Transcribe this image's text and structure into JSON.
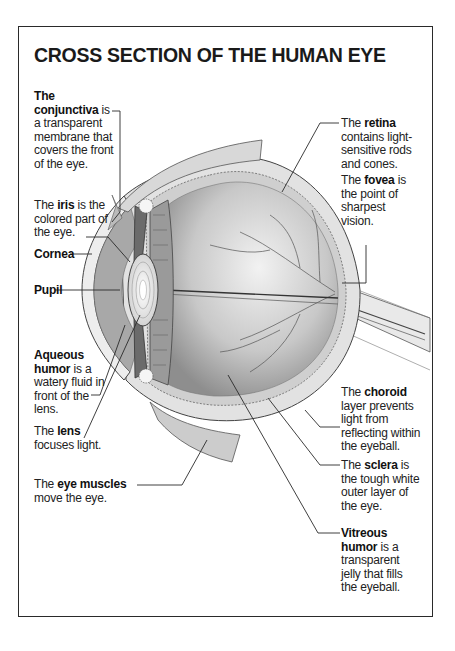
{
  "title": "CROSS SECTION OF THE HUMAN EYE",
  "labels": {
    "conjunctiva": {
      "pre": "The",
      "term": "conjunctiva",
      "post": " is",
      "desc": "a transparent membrane that covers the front of the eye."
    },
    "iris": {
      "pre": "The ",
      "term": "iris",
      "post": " is the colored part of the eye."
    },
    "cornea": {
      "term": "Cornea"
    },
    "pupil": {
      "term": "Pupil"
    },
    "aqueous": {
      "term1": "Aqueous",
      "term2": "humor",
      "post": " is a watery fluid in front of the lens."
    },
    "lens": {
      "pre": "The ",
      "term": "lens",
      "post": " focuses light."
    },
    "muscles": {
      "pre": "The ",
      "term": "eye muscles",
      "post": " move the eye."
    },
    "retina": {
      "pre": "The ",
      "term": "retina",
      "post": " contains light-sensitive rods and cones."
    },
    "fovea": {
      "pre": "The ",
      "term": "fovea",
      "post": " is the point of sharpest vision."
    },
    "choroid": {
      "pre": "The ",
      "term": "choroid",
      "post": " layer prevents light from reflecting within the eyeball."
    },
    "sclera": {
      "pre": "The ",
      "term": "sclera",
      "post": " is the tough white outer layer of the eye."
    },
    "vitreous": {
      "term1": "Vitreous",
      "term2": "humor",
      "post": " is a transparent jelly that fills the eyeball."
    }
  },
  "colors": {
    "ink": "#1a1a1a",
    "line": "#2a2a2a",
    "shade_dark": "#8a8a8a",
    "shade_mid": "#bdbdbd",
    "shade_light": "#e4e4e4"
  }
}
